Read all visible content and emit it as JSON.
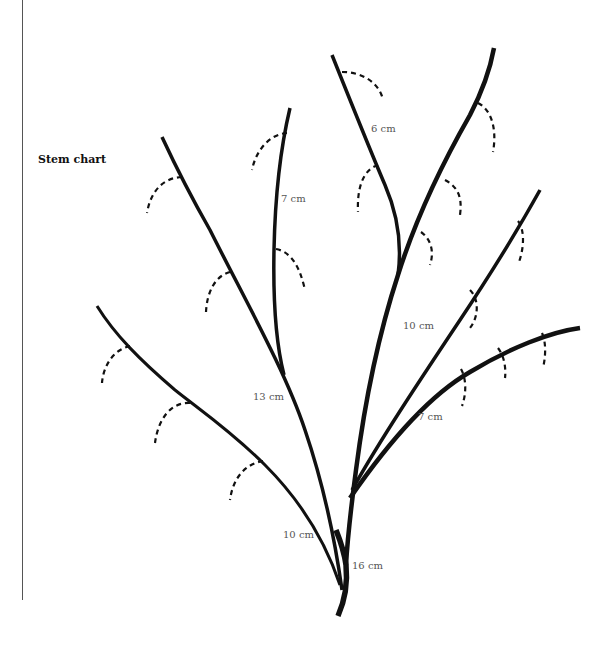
{
  "page": {
    "title": "Stem chart"
  },
  "diagram": {
    "type": "stem-measurement-chart",
    "labels": [
      {
        "id": "label-6cm",
        "text": "6 cm",
        "x": 371,
        "y": 132
      },
      {
        "id": "label-7cm-left",
        "text": "7 cm",
        "x": 281,
        "y": 202
      },
      {
        "id": "label-10cm-right",
        "text": "10 cm",
        "x": 403,
        "y": 329
      },
      {
        "id": "label-13cm",
        "text": "13 cm",
        "x": 253,
        "y": 400
      },
      {
        "id": "label-7cm-right",
        "text": "7 cm",
        "x": 418,
        "y": 420
      },
      {
        "id": "label-10cm-left",
        "text": "10 cm",
        "x": 283,
        "y": 538
      },
      {
        "id": "label-16cm",
        "text": "16 cm",
        "x": 352,
        "y": 569
      }
    ],
    "colors": {
      "stem": "#111111",
      "label": "#555555",
      "rule": "#555555"
    }
  }
}
